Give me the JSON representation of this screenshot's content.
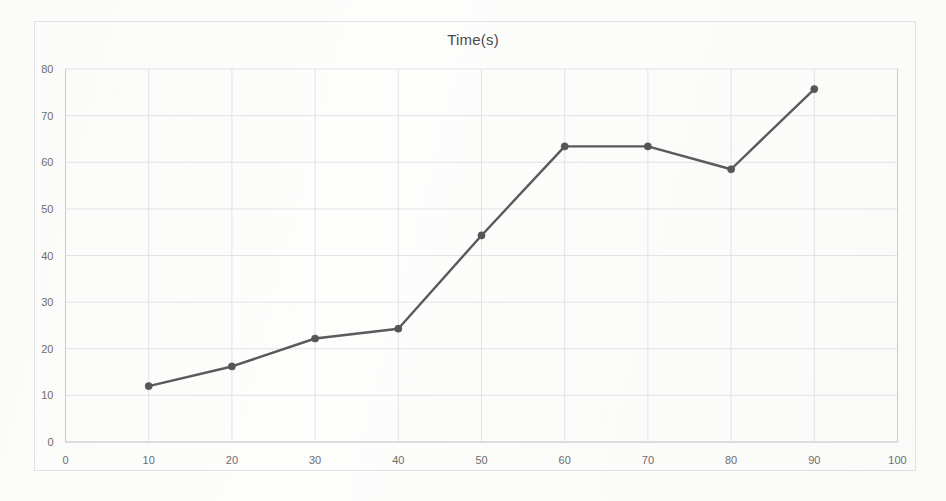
{
  "chart_data": {
    "type": "line",
    "title": "Time(s)",
    "xlabel": "",
    "ylabel": "",
    "x": [
      10,
      20,
      30,
      40,
      50,
      60,
      70,
      80,
      90
    ],
    "values": [
      12.0,
      16.2,
      22.2,
      24.3,
      44.3,
      63.4,
      63.4,
      58.5,
      75.7
    ],
    "series": [
      {
        "name": "Time(s)",
        "values": [
          12.0,
          16.2,
          22.2,
          24.3,
          44.3,
          63.4,
          63.4,
          58.5,
          75.7
        ]
      }
    ],
    "xlim": [
      0,
      100
    ],
    "ylim": [
      0,
      80
    ],
    "x_ticks": [
      "0",
      "10",
      "20",
      "30",
      "40",
      "50",
      "60",
      "70",
      "80",
      "90",
      "100"
    ],
    "y_ticks": [
      "0",
      "10",
      "20",
      "30",
      "40",
      "50",
      "60",
      "70",
      "80"
    ],
    "grid": true,
    "legend": "none",
    "line_color": "#5a5a5a",
    "marker_color": "#565656",
    "gridline_color": "#dfe3e6",
    "axis_color": "#c9cdd1",
    "background_color": "#fdfdfc",
    "marker_shape": "circle"
  }
}
